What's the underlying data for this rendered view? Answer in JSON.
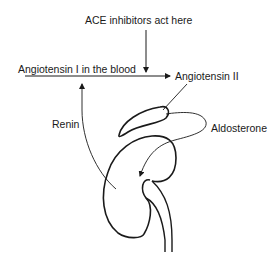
{
  "labels": {
    "ace": "ACE inhibitors act here",
    "angiotensin1": "Angiotensin I in the blood",
    "angiotensin2": "Angiotensin II",
    "renin": "Renin",
    "aldosterone": "Aldosterone"
  },
  "colors": {
    "stroke": "#1a1a1a",
    "background": "#ffffff"
  }
}
